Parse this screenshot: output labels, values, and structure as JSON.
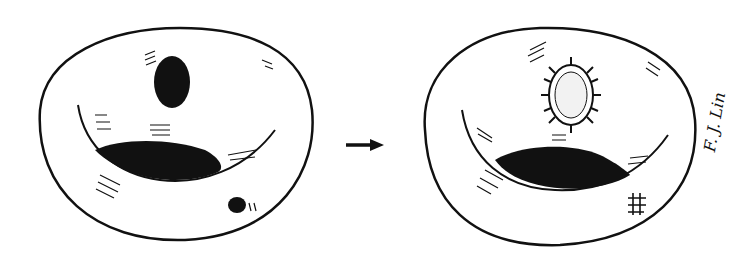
{
  "figure": {
    "panels": [
      {
        "name": "left-cell",
        "features": [
          "dark oval nucleus-like body",
          "dark crescent mass",
          "small dark dot"
        ]
      },
      {
        "name": "right-cell",
        "features": [
          "stippled oval body with radiating fibers",
          "dark crescent mass",
          "cross-hatch mark"
        ]
      }
    ],
    "arrow": "right-arrow",
    "signature": "F. J. Lin",
    "colors": {
      "ink": "#111111",
      "paper": "#ffffff"
    }
  }
}
